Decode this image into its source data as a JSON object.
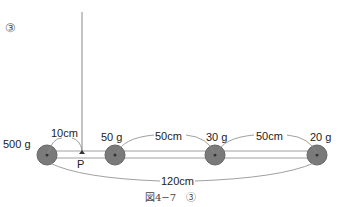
{
  "diagram": {
    "number_label": "③",
    "caption": "図4−7　③",
    "point_label": "P",
    "masses": [
      {
        "label": "500 g",
        "x": 47
      },
      {
        "label": "50 g",
        "x": 115
      },
      {
        "label": "30 g",
        "x": 215
      },
      {
        "label": "20 g",
        "x": 317
      }
    ],
    "distances": {
      "p_offset": "10cm",
      "gap_1": "50cm",
      "gap_2": "50cm",
      "total": "120cm"
    },
    "colors": {
      "mass_fill": "#7a7a7a",
      "bar_line": "#9a9a9a",
      "string": "#8a8a8a"
    }
  }
}
